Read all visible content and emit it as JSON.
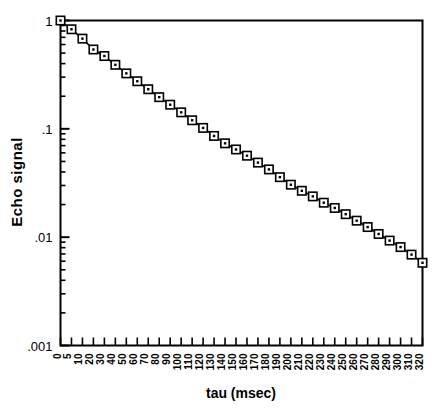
{
  "chart_data": {
    "type": "line",
    "title": "",
    "subtitle": "",
    "xlabel": "tau (msec)",
    "ylabel": "Echo  signal",
    "yscale": "log",
    "xscale": "linear",
    "xlim": [
      0,
      320
    ],
    "ylim": [
      0.001,
      1
    ],
    "grid": false,
    "legend": null,
    "marker": "open-square-with-center-dot",
    "line_style": "solid",
    "line_color": "#000000",
    "marker_face_color": "#ffffff",
    "marker_edge_color": "#000000",
    "ytick_labels": [
      "1",
      ".1",
      ".01",
      ".001"
    ],
    "ytick_values": [
      1,
      0.1,
      0.01,
      0.001
    ],
    "yminor_ticks": true,
    "xtick_labels": [
      "0",
      "5",
      "10",
      "20",
      "30",
      "40",
      "50",
      "60",
      "70",
      "80",
      "90",
      "100",
      "110",
      "120",
      "130",
      "140",
      "150",
      "160",
      "170",
      "180",
      "190",
      "200",
      "210",
      "220",
      "230",
      "240",
      "250",
      "260",
      "270",
      "280",
      "290",
      "300",
      "310",
      "320"
    ],
    "xtick_label_rotation": 90,
    "x": [
      0,
      5,
      10,
      20,
      30,
      40,
      50,
      60,
      70,
      80,
      90,
      100,
      110,
      120,
      130,
      140,
      150,
      160,
      170,
      180,
      190,
      200,
      210,
      220,
      230,
      240,
      250,
      260,
      270,
      280,
      290,
      300,
      310,
      320
    ],
    "values": [
      1.0,
      0.83,
      0.68,
      0.54,
      0.47,
      0.39,
      0.325,
      0.275,
      0.232,
      0.196,
      0.167,
      0.142,
      0.12,
      0.102,
      0.086,
      0.0735,
      0.0645,
      0.0565,
      0.0488,
      0.0422,
      0.0358,
      0.0305,
      0.0268,
      0.0238,
      0.0208,
      0.0186,
      0.0163,
      0.0142,
      0.0124,
      0.0107,
      0.0093,
      0.0081,
      0.0069,
      0.0058
    ],
    "series": [
      {
        "name": "Echo signal",
        "values": [
          1.0,
          0.83,
          0.68,
          0.54,
          0.47,
          0.39,
          0.325,
          0.275,
          0.232,
          0.196,
          0.167,
          0.142,
          0.12,
          0.102,
          0.086,
          0.0735,
          0.0645,
          0.0565,
          0.0488,
          0.0422,
          0.0358,
          0.0305,
          0.0268,
          0.0238,
          0.0208,
          0.0186,
          0.0163,
          0.0142,
          0.0124,
          0.0107,
          0.0093,
          0.0081,
          0.0069,
          0.0058
        ]
      }
    ],
    "colors": {
      "axis": "#000000",
      "data": "#000000",
      "background": "#ffffff"
    }
  }
}
